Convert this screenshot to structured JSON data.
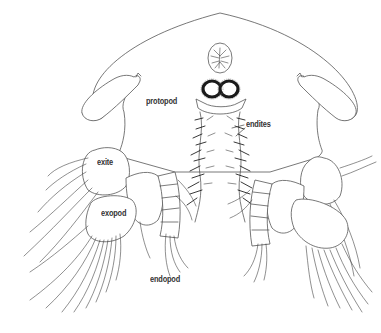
{
  "figure": {
    "colors": {
      "background": "#ffffff",
      "line": "#444444",
      "label_text": "#333333"
    }
  },
  "labels": {
    "protopod": "protopod",
    "endites": "endites",
    "exite": "exite",
    "exopod": "exopod",
    "endopod": "endopod"
  }
}
